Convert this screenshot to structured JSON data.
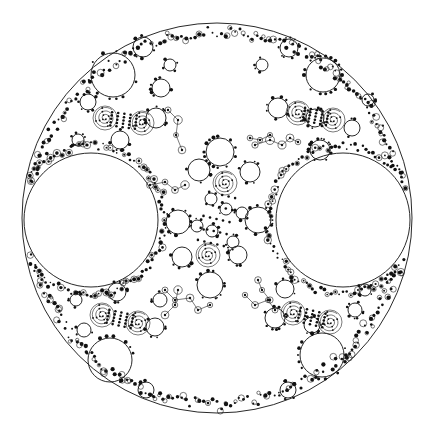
{
  "figure": {
    "background": "#ffffff",
    "ink": "#111111",
    "outer_circle": {
      "cx": 217,
      "cy": 218,
      "r": 195
    },
    "large_disks": [
      {
        "name": "left-disk",
        "cx": 91,
        "cy": 220,
        "r": 67
      },
      {
        "name": "right-disk",
        "cx": 343,
        "cy": 220,
        "r": 67
      }
    ],
    "clusters": [
      {
        "name": "upper-left",
        "big": {
          "cx": 113,
          "cy": 75,
          "r": 22
        },
        "spirals": [
          {
            "cx": 105,
            "cy": 118
          },
          {
            "cx": 142,
            "cy": 123
          }
        ],
        "circles": [
          {
            "cx": 143,
            "cy": 47,
            "r": 10
          },
          {
            "cx": 161,
            "cy": 88,
            "r": 9
          },
          {
            "cx": 88,
            "cy": 102,
            "r": 8
          },
          {
            "cx": 120,
            "cy": 140,
            "r": 9
          },
          {
            "cx": 156,
            "cy": 118,
            "r": 10
          },
          {
            "cx": 78,
            "cy": 140,
            "r": 6
          },
          {
            "cx": 170,
            "cy": 65,
            "r": 6
          }
        ]
      },
      {
        "name": "upper-right",
        "big": {
          "cx": 323,
          "cy": 75,
          "r": 17
        },
        "spirals": [
          {
            "cx": 298,
            "cy": 113
          },
          {
            "cx": 333,
            "cy": 120
          }
        ],
        "circles": [
          {
            "cx": 289,
            "cy": 48,
            "r": 9
          },
          {
            "cx": 278,
            "cy": 108,
            "r": 10
          },
          {
            "cx": 315,
            "cy": 118,
            "r": 9
          },
          {
            "cx": 352,
            "cy": 128,
            "r": 8
          },
          {
            "cx": 320,
            "cy": 150,
            "r": 10
          },
          {
            "cx": 368,
            "cy": 100,
            "r": 6
          },
          {
            "cx": 262,
            "cy": 65,
            "r": 6
          }
        ]
      },
      {
        "name": "lower-left",
        "big": {
          "cx": 110,
          "cy": 360,
          "r": 22
        },
        "spirals": [
          {
            "cx": 102,
            "cy": 315
          },
          {
            "cx": 138,
            "cy": 323
          }
        ],
        "circles": [
          {
            "cx": 117,
            "cy": 292,
            "r": 9
          },
          {
            "cx": 155,
            "cy": 327,
            "r": 9
          },
          {
            "cx": 84,
            "cy": 330,
            "r": 7
          },
          {
            "cx": 146,
            "cy": 390,
            "r": 8
          },
          {
            "cx": 76,
            "cy": 300,
            "r": 6
          },
          {
            "cx": 160,
            "cy": 300,
            "r": 7
          }
        ]
      },
      {
        "name": "lower-right",
        "big": {
          "cx": 322,
          "cy": 355,
          "r": 22
        },
        "spirals": [
          {
            "cx": 293,
            "cy": 313
          },
          {
            "cx": 330,
            "cy": 322
          }
        ],
        "circles": [
          {
            "cx": 285,
            "cy": 289,
            "r": 9
          },
          {
            "cx": 275,
            "cy": 318,
            "r": 10
          },
          {
            "cx": 312,
            "cy": 325,
            "r": 8
          },
          {
            "cx": 355,
            "cy": 310,
            "r": 7
          },
          {
            "cx": 288,
            "cy": 390,
            "r": 8
          },
          {
            "cx": 365,
            "cy": 290,
            "r": 6
          }
        ]
      },
      {
        "name": "center",
        "big": {
          "cx": 220,
          "cy": 152,
          "r": 14
        },
        "spirals": [
          {
            "cx": 225,
            "cy": 183
          },
          {
            "cx": 208,
            "cy": 255
          }
        ],
        "circles": [
          {
            "cx": 199,
            "cy": 170,
            "r": 11
          },
          {
            "cx": 250,
            "cy": 172,
            "r": 10
          },
          {
            "cx": 211,
            "cy": 199,
            "r": 6
          },
          {
            "cx": 226,
            "cy": 209,
            "r": 6
          },
          {
            "cx": 242,
            "cy": 213,
            "r": 6
          },
          {
            "cx": 258,
            "cy": 220,
            "r": 13
          },
          {
            "cx": 178,
            "cy": 222,
            "r": 12
          },
          {
            "cx": 197,
            "cy": 226,
            "r": 6
          },
          {
            "cx": 212,
            "cy": 231,
            "r": 6
          },
          {
            "cx": 182,
            "cy": 257,
            "r": 10
          },
          {
            "cx": 238,
            "cy": 255,
            "r": 9
          },
          {
            "cx": 210,
            "cy": 285,
            "r": 13
          },
          {
            "cx": 233,
            "cy": 242,
            "r": 6
          }
        ]
      }
    ],
    "tendrils": [
      {
        "name": "center-upper-right",
        "points": [
          [
            255,
            145
          ],
          [
            270,
            140
          ],
          [
            282,
            145
          ],
          [
            290,
            138
          ],
          [
            298,
            142
          ]
        ]
      },
      {
        "name": "center-left",
        "points": [
          [
            150,
            185
          ],
          [
            165,
            182
          ],
          [
            175,
            190
          ],
          [
            185,
            185
          ]
        ]
      },
      {
        "name": "center-lower-left",
        "points": [
          [
            165,
            290
          ],
          [
            175,
            300
          ],
          [
            190,
            298
          ],
          [
            198,
            310
          ],
          [
            210,
            305
          ]
        ]
      },
      {
        "name": "center-right",
        "points": [
          [
            245,
            295
          ],
          [
            255,
            305
          ],
          [
            268,
            300
          ],
          [
            275,
            310
          ]
        ]
      },
      {
        "name": "upper-left-arm",
        "points": [
          [
            168,
            110
          ],
          [
            178,
            120
          ],
          [
            176,
            135
          ],
          [
            182,
            150
          ]
        ]
      },
      {
        "name": "upper-right-arm",
        "points": [
          [
            270,
            135
          ],
          [
            260,
            140
          ],
          [
            250,
            138
          ]
        ]
      },
      {
        "name": "lower-right-arm",
        "points": [
          [
            270,
            300
          ],
          [
            262,
            290
          ],
          [
            258,
            280
          ]
        ]
      },
      {
        "name": "lower-left-arm",
        "points": [
          [
            165,
            315
          ],
          [
            175,
            305
          ],
          [
            178,
            290
          ]
        ]
      }
    ]
  }
}
